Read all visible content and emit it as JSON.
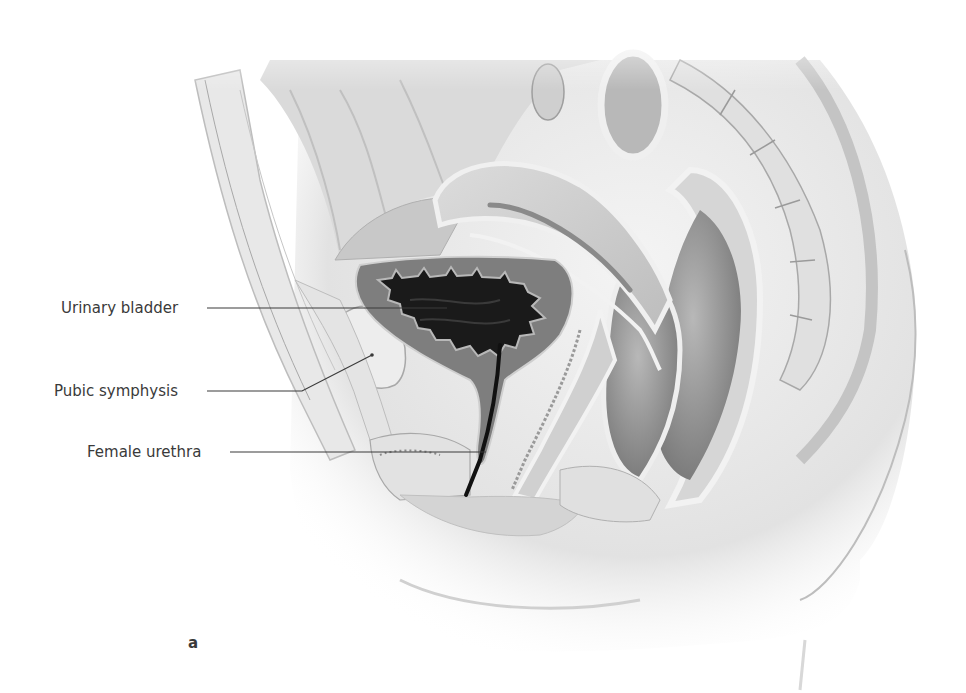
{
  "figure": {
    "panel_letter": "a",
    "labels": [
      {
        "text": "Urinary bladder",
        "x": 61,
        "y": 299,
        "line_from": [
          207,
          308
        ],
        "line_to": [
          447,
          308
        ]
      },
      {
        "text": "Pubic symphysis",
        "x": 54,
        "y": 382,
        "line_from": [
          207,
          391
        ],
        "line_to": [
          372,
          355
        ],
        "line_elbow": [
          302,
          391
        ]
      },
      {
        "text": "Female urethra",
        "x": 87,
        "y": 443,
        "line_from": [
          230,
          452
        ],
        "line_to": [
          486,
          452
        ]
      }
    ],
    "colors": {
      "background": "#ffffff",
      "label_text": "#3a3a3a",
      "leader_line": "#3a3a3a",
      "tissue_light": "#e6e6e6",
      "tissue_mid": "#c4c4c4",
      "tissue_dark": "#8a8a8a",
      "bladder_wall": "#7a7a7a",
      "bladder_lumen": "#1a1a1a",
      "skin_shadow": "#d9d9d9"
    }
  }
}
